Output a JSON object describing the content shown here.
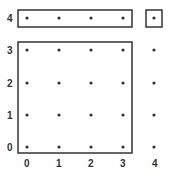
{
  "diagram": {
    "x_labels": [
      "0",
      "1",
      "2",
      "3",
      "4"
    ],
    "y_labels": [
      "0",
      "1",
      "2",
      "3",
      "4"
    ],
    "grid_size": 5,
    "boxes": [
      {
        "name": "top-row-box",
        "covers": "x 0-3, y 4"
      },
      {
        "name": "corner-box",
        "covers": "x 4, y 4"
      },
      {
        "name": "main-square-box",
        "covers": "x 0-3, y 0-3"
      }
    ],
    "colors": {
      "stroke": "#333333",
      "dot": "#333333",
      "background": "#ffffff"
    }
  }
}
